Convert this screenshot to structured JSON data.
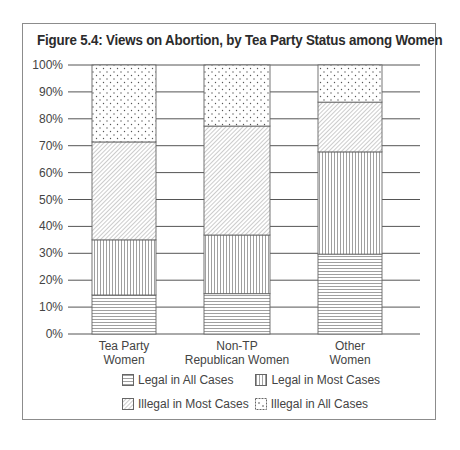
{
  "chart_data": {
    "type": "bar",
    "stacked": true,
    "title": "Figure 5.4: Views on Abortion, by Tea Party Status among Women",
    "xlabel": "",
    "ylabel": "",
    "ylim": [
      0,
      100
    ],
    "yticks": [
      "0%",
      "10%",
      "20%",
      "30%",
      "40%",
      "50%",
      "60%",
      "70%",
      "80%",
      "90%",
      "100%"
    ],
    "categories": [
      "Tea Party Women",
      "Non-TP Republican Women",
      "Other Women"
    ],
    "category_lines": [
      [
        "Tea Party",
        "Women"
      ],
      [
        "Non-TP",
        "Republican Women"
      ],
      [
        "Other",
        "Women"
      ]
    ],
    "series": [
      {
        "name": "Legal in All Cases",
        "pattern": "horizontal-lines",
        "values": [
          14.5,
          15,
          29.7
        ]
      },
      {
        "name": "Legal in Most Cases",
        "pattern": "vertical-lines",
        "values": [
          20.5,
          21.8,
          38
        ]
      },
      {
        "name": "Illegal in Most Cases",
        "pattern": "diagonal-lines",
        "values": [
          36.4,
          40.5,
          18.5
        ]
      },
      {
        "name": "Illegal in All Cases",
        "pattern": "dots",
        "values": [
          28.6,
          22.7,
          13.8
        ]
      }
    ],
    "grid": true,
    "legend_position": "bottom"
  },
  "legend": {
    "row1": [
      "Legal in All Cases",
      "Legal in Most Cases"
    ],
    "row2": [
      "Illegal in Most Cases",
      "Illegal in All Cases"
    ]
  }
}
